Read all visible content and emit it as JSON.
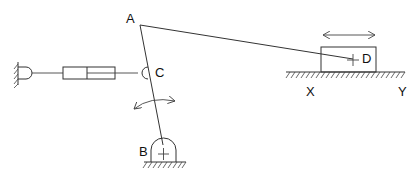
{
  "diagram": {
    "type": "mechanism",
    "labels": {
      "A": "A",
      "B": "B",
      "C": "C",
      "D": "D",
      "X": "X",
      "Y": "Y"
    },
    "colors": {
      "stroke": "#333333",
      "background": "#ffffff"
    },
    "components": [
      {
        "name": "rocker-link",
        "from": "B",
        "to": "A"
      },
      {
        "name": "connecting-rod",
        "from": "A",
        "to": "D"
      },
      {
        "name": "slider-block",
        "at": "D"
      },
      {
        "name": "ground-track",
        "from": "X",
        "to": "Y"
      },
      {
        "name": "cylinder-actuator",
        "from": "wall",
        "to": "C"
      },
      {
        "name": "pivot-support",
        "at": "B"
      }
    ],
    "motions": [
      {
        "name": "block-translation-arrow",
        "type": "double-headed-linear"
      },
      {
        "name": "rocker-oscillation-arrow",
        "type": "double-headed-curved"
      }
    ]
  }
}
